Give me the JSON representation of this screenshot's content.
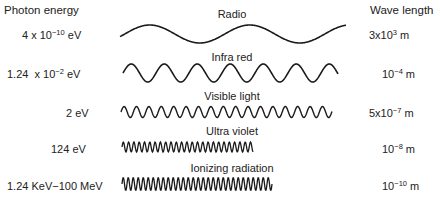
{
  "headers": {
    "left": "Photon energy",
    "right": "Wave length"
  },
  "bands": [
    {
      "name": "Radio",
      "energy_base": "4 x 10",
      "energy_exp": "−10",
      "energy_unit": " eV",
      "wl_base": "3x10",
      "wl_exp": "3",
      "wl_unit": " m",
      "wave": {
        "x0": 120,
        "x1": 346,
        "cy": 34,
        "amp": 9,
        "period": 100,
        "phase": -0.3
      }
    },
    {
      "name": "Infra red",
      "energy_base": "1.24  x 10",
      "energy_exp": "−2",
      "energy_unit": " eV",
      "wl_base": "10",
      "wl_exp": "−4",
      "wl_unit": " m",
      "wave": {
        "x0": 123,
        "x1": 338,
        "cy": 73,
        "amp": 9,
        "period": 33,
        "phase": 0.0
      }
    },
    {
      "name": "Visible light",
      "energy_base": "2 eV",
      "energy_exp": "",
      "energy_unit": "",
      "wl_base": "5x10",
      "wl_exp": "−7",
      "wl_unit": " m",
      "wave": {
        "x0": 121,
        "x1": 332,
        "cy": 112,
        "amp": 5.5,
        "period": 12.4,
        "phase": 0.0
      }
    },
    {
      "name": "Ultra violet",
      "energy_base": "124 eV",
      "energy_exp": "",
      "energy_unit": "",
      "wl_base": "10",
      "wl_exp": "−8",
      "wl_unit": " m",
      "wave": {
        "x0": 122,
        "x1": 253,
        "cy": 147,
        "amp": 5,
        "period": 5.3,
        "phase": 0.0
      }
    },
    {
      "name": "Ionizing radiation",
      "energy_base": "1.24 KeV−100 MeV",
      "energy_exp": "",
      "energy_unit": "",
      "wl_base": "10",
      "wl_exp": "−10",
      "wl_unit": " m",
      "wave": {
        "x0": 122,
        "x1": 272,
        "cy": 184,
        "amp": 6.5,
        "period": 5,
        "phase": 0.0
      }
    }
  ],
  "colors": {
    "wave": "#1a1a1a",
    "text": "#222222"
  }
}
